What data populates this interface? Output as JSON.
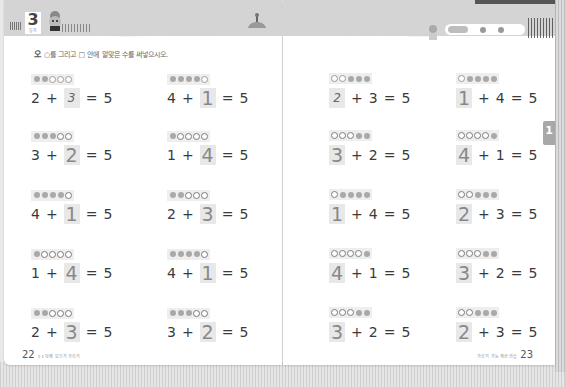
{
  "book": {
    "left_page": {
      "chapter_number": "3",
      "chapter_sub": "일차",
      "instruction": "○를 그리고 □ 안에 알맞은 수를 써넣으시오.",
      "page_number": "22",
      "footer_text": "1·1 덧셈 모으기 가르기",
      "problems": [
        {
          "dots": [
            "filled",
            "filled",
            "empty-thin",
            "empty-thin",
            "empty-thin"
          ],
          "a": "2",
          "op": "+",
          "answer": "3",
          "answer_style": "hand",
          "blank_position": "second",
          "eq": "=",
          "total": "5"
        },
        {
          "dots": [
            "filled",
            "filled",
            "filled",
            "filled",
            "empty-thin"
          ],
          "a": "4",
          "op": "+",
          "answer": "1",
          "blank_position": "second",
          "eq": "=",
          "total": "5"
        },
        {
          "dots": [
            "filled",
            "filled",
            "filled",
            "empty-bold",
            "empty-bold"
          ],
          "a": "3",
          "op": "+",
          "answer": "2",
          "blank_position": "second",
          "eq": "=",
          "total": "5"
        },
        {
          "dots": [
            "filled",
            "empty-bold",
            "empty-bold",
            "empty-bold",
            "empty-bold"
          ],
          "a": "1",
          "op": "+",
          "answer": "4",
          "blank_position": "second",
          "eq": "=",
          "total": "5"
        },
        {
          "dots": [
            "filled",
            "filled",
            "filled",
            "filled",
            "empty-bold"
          ],
          "a": "4",
          "op": "+",
          "answer": "1",
          "blank_position": "second",
          "eq": "=",
          "total": "5"
        },
        {
          "dots": [
            "filled",
            "filled",
            "empty-bold",
            "empty-bold",
            "empty-bold"
          ],
          "a": "2",
          "op": "+",
          "answer": "3",
          "blank_position": "second",
          "eq": "=",
          "total": "5"
        },
        {
          "dots": [
            "filled",
            "empty-bold",
            "empty-bold",
            "empty-bold",
            "empty-bold"
          ],
          "a": "1",
          "op": "+",
          "answer": "4",
          "blank_position": "second",
          "eq": "=",
          "total": "5"
        },
        {
          "dots": [
            "filled",
            "filled",
            "filled",
            "filled",
            "empty-bold"
          ],
          "a": "4",
          "op": "+",
          "answer": "1",
          "blank_position": "second",
          "eq": "=",
          "total": "5"
        },
        {
          "dots": [
            "filled",
            "filled",
            "empty-bold",
            "empty-bold",
            "empty-bold"
          ],
          "a": "2",
          "op": "+",
          "answer": "3",
          "blank_position": "second",
          "eq": "=",
          "total": "5"
        },
        {
          "dots": [
            "filled",
            "filled",
            "filled",
            "empty-bold",
            "empty-bold"
          ],
          "a": "3",
          "op": "+",
          "answer": "2",
          "blank_position": "second",
          "eq": "=",
          "total": "5"
        }
      ]
    },
    "right_page": {
      "chapter_tab": "1",
      "page_number": "23",
      "footer_text": "가르기 가능 계산 연습",
      "problems": [
        {
          "dots": [
            "empty-thin",
            "empty-thin",
            "filled",
            "filled",
            "filled"
          ],
          "answer": "2",
          "answer_style": "hand",
          "op": "+",
          "b": "3",
          "eq": "=",
          "total": "5"
        },
        {
          "dots": [
            "empty-thin",
            "filled",
            "filled",
            "filled",
            "filled"
          ],
          "answer": "1",
          "op": "+",
          "b": "4",
          "eq": "=",
          "total": "5"
        },
        {
          "dots": [
            "empty-bold",
            "empty-bold",
            "empty-bold",
            "filled",
            "filled"
          ],
          "answer": "3",
          "op": "+",
          "b": "2",
          "eq": "=",
          "total": "5"
        },
        {
          "dots": [
            "empty-bold",
            "empty-bold",
            "empty-bold",
            "empty-bold",
            "filled"
          ],
          "answer": "4",
          "op": "+",
          "b": "1",
          "eq": "=",
          "total": "5"
        },
        {
          "dots": [
            "empty-bold",
            "filled",
            "filled",
            "filled",
            "filled"
          ],
          "answer": "1",
          "op": "+",
          "b": "4",
          "eq": "=",
          "total": "5"
        },
        {
          "dots": [
            "empty-bold",
            "empty-bold",
            "filled",
            "filled",
            "filled"
          ],
          "answer": "2",
          "op": "+",
          "b": "3",
          "eq": "=",
          "total": "5"
        },
        {
          "dots": [
            "empty-bold",
            "empty-bold",
            "empty-bold",
            "empty-bold",
            "filled"
          ],
          "answer": "4",
          "op": "+",
          "b": "1",
          "eq": "=",
          "total": "5"
        },
        {
          "dots": [
            "empty-bold",
            "empty-bold",
            "empty-bold",
            "filled",
            "filled"
          ],
          "answer": "3",
          "op": "+",
          "b": "2",
          "eq": "=",
          "total": "5"
        },
        {
          "dots": [
            "empty-bold",
            "empty-bold",
            "empty-bold",
            "filled",
            "filled"
          ],
          "answer": "3",
          "op": "+",
          "b": "2",
          "eq": "=",
          "total": "5"
        },
        {
          "dots": [
            "empty-bold",
            "empty-bold",
            "filled",
            "filled",
            "filled"
          ],
          "answer": "2",
          "op": "+",
          "b": "3",
          "eq": "=",
          "total": "5"
        }
      ]
    }
  },
  "colors": {
    "header_band": "#d4d4d4",
    "answer_box": "#e8e8e8",
    "dot_filled": "#a9a9a9",
    "chapter_tab": "#a8a8a8"
  }
}
